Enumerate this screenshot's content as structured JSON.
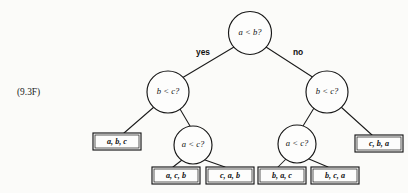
{
  "figure": {
    "label": "(9.3F)",
    "label_x": 17,
    "label_y": 87
  },
  "canvas": {
    "width": 408,
    "height": 193,
    "background": "#fbfbf9",
    "ink_color": "#161616"
  },
  "diagram": {
    "type": "decision-tree"
  },
  "nodes": [
    {
      "id": "root",
      "label": "a < b?",
      "cx": 250,
      "cy": 33,
      "r": 21.5
    },
    {
      "id": "left-b-c",
      "label": "b < c?",
      "cx": 168,
      "cy": 92,
      "r": 21.0
    },
    {
      "id": "right-b-c",
      "label": "b < c?",
      "cx": 327,
      "cy": 92,
      "r": 21.0
    },
    {
      "id": "left-a-c",
      "label": "a < c?",
      "cx": 193,
      "cy": 145,
      "r": 19.0
    },
    {
      "id": "right-a-c",
      "label": "a < c?",
      "cx": 297,
      "cy": 144,
      "r": 19.0
    }
  ],
  "edge_labels": [
    {
      "id": "yes-label",
      "text": "yes",
      "x": 203,
      "y": 53
    },
    {
      "id": "no-label",
      "text": "no",
      "x": 298,
      "y": 53
    }
  ],
  "leaves": [
    {
      "id": "leaf-abc",
      "label": "a, b, c",
      "x": 93,
      "y": 133,
      "w": 48,
      "h": 17
    },
    {
      "id": "leaf-acb",
      "label": "a, c, b",
      "x": 152,
      "y": 167,
      "w": 48,
      "h": 17
    },
    {
      "id": "leaf-cab",
      "label": "c, a, b",
      "x": 206,
      "y": 167,
      "w": 48,
      "h": 17
    },
    {
      "id": "leaf-bac",
      "label": "b, a, c",
      "x": 258,
      "y": 167,
      "w": 48,
      "h": 17
    },
    {
      "id": "leaf-bca",
      "label": "b, c, a",
      "x": 311,
      "y": 167,
      "w": 48,
      "h": 17
    },
    {
      "id": "leaf-cba",
      "label": "c, b, a",
      "x": 355,
      "y": 135,
      "w": 48,
      "h": 17
    }
  ],
  "edges": [
    {
      "id": "edge-root-left",
      "x1": 234,
      "y1": 47,
      "x2": 182,
      "y2": 78
    },
    {
      "id": "edge-root-right",
      "x1": 266,
      "y1": 47,
      "x2": 314,
      "y2": 78
    },
    {
      "id": "edge-leftbc-abc",
      "x1": 154,
      "y1": 107,
      "x2": 124,
      "y2": 133
    },
    {
      "id": "edge-leftbc-leftac",
      "x1": 180,
      "y1": 109,
      "x2": 190,
      "y2": 126
    },
    {
      "id": "edge-leftac-acb",
      "x1": 182,
      "y1": 160,
      "x2": 173,
      "y2": 167
    },
    {
      "id": "edge-leftac-cab",
      "x1": 205,
      "y1": 160,
      "x2": 225,
      "y2": 167
    },
    {
      "id": "edge-rightbc-rightac",
      "x1": 314,
      "y1": 108,
      "x2": 303,
      "y2": 126
    },
    {
      "id": "edge-rightbc-cba",
      "x1": 341,
      "y1": 107,
      "x2": 372,
      "y2": 135
    },
    {
      "id": "edge-rightac-bac",
      "x1": 286,
      "y1": 159,
      "x2": 278,
      "y2": 167
    },
    {
      "id": "edge-rightac-bca",
      "x1": 309,
      "y1": 159,
      "x2": 328,
      "y2": 167
    }
  ]
}
